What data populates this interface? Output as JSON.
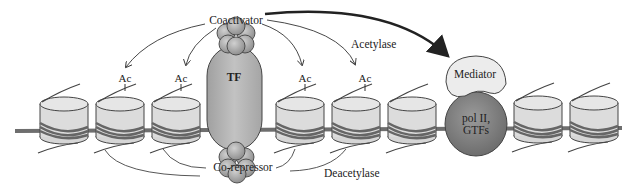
{
  "labels": {
    "coactivator": "Coactivator",
    "corepressor": "Co-repressor",
    "tf": "TF",
    "acetylase": "Acetylase",
    "deacetylase": "Deacetylase",
    "mediator": "Mediator",
    "pol_line1": "pol II,",
    "pol_line2": "GTFs",
    "ac": [
      "Ac",
      "Ac",
      "Ac",
      "Ac"
    ]
  },
  "colors": {
    "nucleosome_fill": "#dcdcdc",
    "dna": "#6e6e6e",
    "tf_fill": "#b4b4b4",
    "protein_ball": "#a8a8a8",
    "mediator_fill": "#ececec",
    "pol_fill": "#7d7d7d",
    "line": "#333333"
  }
}
